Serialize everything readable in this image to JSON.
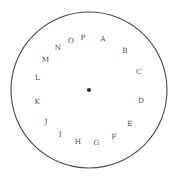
{
  "figure": {
    "name": "labeled-sector-wheel",
    "background_color": "#ffffff",
    "width": 178,
    "height": 180
  },
  "circle": {
    "center_x": 89,
    "center_y": 90,
    "radius": 78,
    "rim_color": "#4a4a4a",
    "spoke_color": "#6f6f6f",
    "hub_color": "#2b2b2b",
    "label_color": "#4d4d4d"
  },
  "chart_data": {
    "type": "pie",
    "title": "",
    "xlabel": "",
    "ylabel": "",
    "legend_position": "none",
    "grid": false,
    "labels_inside_slices": true,
    "label_radius_fraction": 0.68,
    "start_angle_deg": -90,
    "direction": "clockwise",
    "categories": [
      "A",
      "B",
      "C",
      "D",
      "E",
      "F",
      "G",
      "H",
      "I",
      "J",
      "K",
      "L",
      "M",
      "N",
      "O",
      "P"
    ],
    "values": [
      30,
      25,
      30,
      32,
      25,
      20,
      20,
      20,
      22,
      20,
      28,
      23,
      20,
      18,
      14,
      13
    ],
    "angles_deg": [
      30,
      25,
      30,
      32,
      25,
      20,
      20,
      20,
      22,
      20,
      28,
      23,
      20,
      18,
      14,
      13
    ],
    "boundaries_deg": [
      -90,
      -60,
      -35,
      -5,
      27,
      52,
      72,
      92,
      112,
      134,
      154,
      182,
      205,
      225,
      243,
      257,
      270
    ]
  },
  "labels": {
    "A": "A",
    "B": "B",
    "C": "C",
    "D": "D",
    "E": "E",
    "F": "F",
    "G": "G",
    "H": "H",
    "I": "I",
    "J": "J",
    "K": "K",
    "L": "L",
    "M": "M",
    "N": "N",
    "O": "O",
    "P": "P"
  }
}
